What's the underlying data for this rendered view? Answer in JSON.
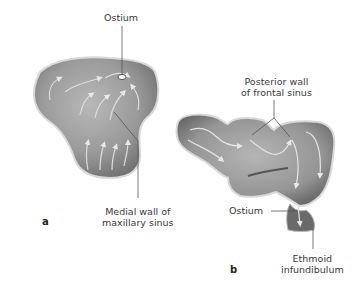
{
  "figure": {
    "panels": [
      {
        "letter": "a",
        "subject": "maxillary sinus",
        "labels": {
          "ostium": "Ostium",
          "medial_wall_line1": "Medial wall of",
          "medial_wall_line2": "maxillary sinus"
        }
      },
      {
        "letter": "b",
        "subject": "frontal sinus",
        "labels": {
          "posterior_wall_line1": "Posterior wall",
          "posterior_wall_line2": "of frontal sinus",
          "ostium": "Ostium",
          "ethmoid_line1": "Ethmoid",
          "ethmoid_line2": "infundibulum"
        }
      }
    ],
    "colors": {
      "sinus_fill": "#9a9a9a",
      "sinus_shadow": "#6e6e6e",
      "sinus_highlight": "#c4c4c4",
      "leader_line": "#555555",
      "background": "#ffffff"
    }
  }
}
